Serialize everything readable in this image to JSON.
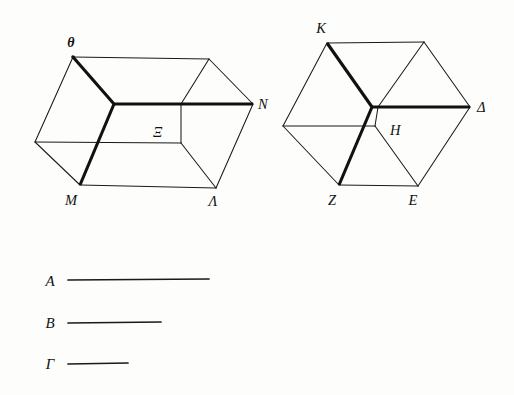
{
  "figure": {
    "ink_color": "#1a1a18",
    "background_color": "#fdfdfc",
    "solids": [
      {
        "name": "left-parallelepiped",
        "description": "Oblique parallelepiped (elongated box) with labelled vertices",
        "labels": [
          {
            "id": "theta",
            "text": "θ",
            "x": 71,
            "y": 47,
            "bold": true
          },
          {
            "id": "nu",
            "text": "N",
            "x": 258,
            "y": 109,
            "bold": false
          },
          {
            "id": "xi",
            "text": "Ξ",
            "x": 153,
            "y": 137,
            "bold": false
          },
          {
            "id": "mu",
            "text": "M",
            "x": 71,
            "y": 205,
            "bold": false
          },
          {
            "id": "lambda",
            "text": "Λ",
            "x": 213,
            "y": 206,
            "bold": false
          }
        ]
      },
      {
        "name": "right-cube",
        "description": "Oblique cube with labelled vertices",
        "labels": [
          {
            "id": "kappa",
            "text": "K",
            "x": 321,
            "y": 33,
            "bold": false
          },
          {
            "id": "delta",
            "text": "Δ",
            "x": 477,
            "y": 112,
            "bold": false
          },
          {
            "id": "eta",
            "text": "H",
            "x": 390,
            "y": 135,
            "bold": false
          },
          {
            "id": "zeta",
            "text": "Z",
            "x": 332,
            "y": 205,
            "bold": false
          },
          {
            "id": "epsilon",
            "text": "E",
            "x": 413,
            "y": 205,
            "bold": false
          }
        ]
      }
    ],
    "segments": [
      {
        "id": "segment-a",
        "label": "A",
        "label_x": 50,
        "label_y": 286,
        "x1": 68,
        "x2": 209,
        "y": 280,
        "length_px": 141
      },
      {
        "id": "segment-b",
        "label": "B",
        "label_x": 50,
        "label_y": 328,
        "x1": 68,
        "x2": 161,
        "y": 323,
        "length_px": 93
      },
      {
        "id": "segment-gamma",
        "label": "Γ",
        "label_x": 50,
        "label_y": 369,
        "x1": 68,
        "x2": 128,
        "y": 364,
        "length_px": 60
      }
    ]
  }
}
